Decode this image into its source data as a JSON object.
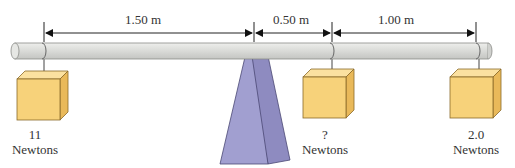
{
  "diagram": {
    "type": "lever-balance",
    "colors": {
      "bar_fill": "#d8d9d6",
      "bar_stroke": "#8a8c88",
      "block_fill": "#f7d27a",
      "block_side": "#e9b95a",
      "block_top": "#fbe1a0",
      "block_stroke": "#8a6a2a",
      "fulcrum_fill": "#9e9ccc",
      "fulcrum_dark": "#8b88bd",
      "fulcrum_stroke": "#4a4873",
      "dimension_line": "#222222",
      "text": "#333333"
    },
    "dimensions": [
      {
        "id": "left-span",
        "label": "1.50 m"
      },
      {
        "id": "middle-span",
        "label": "0.50 m"
      },
      {
        "id": "right-span",
        "label": "1.00 m"
      }
    ],
    "weights": [
      {
        "id": "left-block",
        "value": "11",
        "unit": "Newtons"
      },
      {
        "id": "middle-block",
        "value": "?",
        "unit": "Newtons"
      },
      {
        "id": "right-block",
        "value": "2.0",
        "unit": "Newtons"
      }
    ]
  }
}
